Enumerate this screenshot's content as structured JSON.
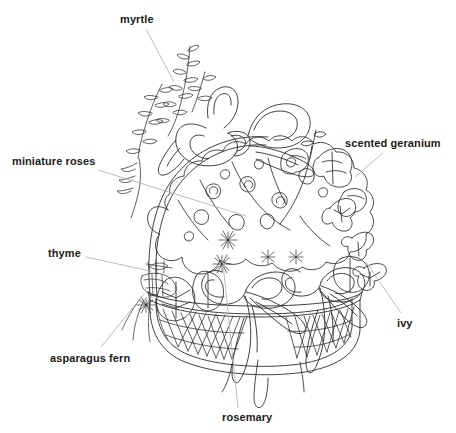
{
  "figure": {
    "background_color": "#ffffff",
    "ink_color": "#2b2b2b",
    "leader_color": "#b4b4b4",
    "label_color": "#1b1b1b"
  },
  "labels": [
    {
      "id": "myrtle",
      "text": "myrtle",
      "x": 120,
      "y": 13,
      "leader": {
        "x1": 146,
        "y1": 29,
        "x2": 174,
        "y2": 82
      }
    },
    {
      "id": "miniature-roses",
      "text": "miniature roses",
      "x": 12,
      "y": 155,
      "leader": {
        "x1": 98,
        "y1": 170,
        "x2": 246,
        "y2": 216
      }
    },
    {
      "id": "scented-geranium",
      "text": "scented geranium",
      "x": 345,
      "y": 137,
      "leader": {
        "x1": 383,
        "y1": 153,
        "x2": 355,
        "y2": 177
      }
    },
    {
      "id": "thyme",
      "text": "thyme",
      "x": 48,
      "y": 247,
      "leader": {
        "x1": 86,
        "y1": 257,
        "x2": 150,
        "y2": 271
      }
    },
    {
      "id": "asparagus-fern",
      "text": "asparagus fern",
      "x": 50,
      "y": 352,
      "leader": {
        "x1": 101,
        "y1": 347,
        "x2": 144,
        "y2": 294
      }
    },
    {
      "id": "rosemary",
      "text": "rosemary",
      "x": 222,
      "y": 411,
      "leader": {
        "x1": 238,
        "y1": 408,
        "x2": 222,
        "y2": 254
      }
    },
    {
      "id": "ivy",
      "text": "ivy",
      "x": 397,
      "y": 317,
      "leader": {
        "x1": 401,
        "y1": 313,
        "x2": 366,
        "y2": 262
      }
    }
  ]
}
